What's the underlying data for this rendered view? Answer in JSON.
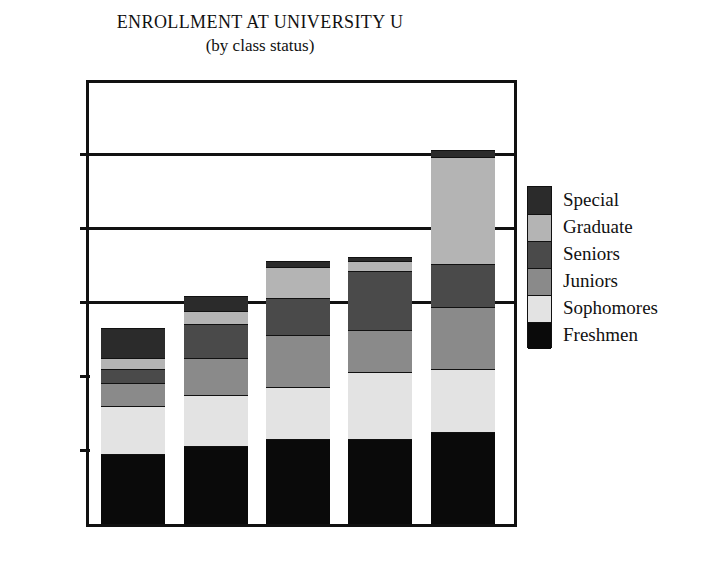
{
  "chart_data": {
    "type": "bar",
    "subtype": "stacked",
    "title": "ENROLLMENT AT UNIVERSITY U",
    "subtitle": "(by class status)",
    "xlabel": "",
    "ylabel": "",
    "categories": [
      "1991",
      "1992",
      "1993",
      "1994",
      "1995"
    ],
    "ytick_labels": [
      "1000",
      "2000",
      "3000",
      "4000",
      "5000"
    ],
    "ytick_values": [
      1000,
      2000,
      3000,
      4000,
      5000
    ],
    "ylim": [
      0,
      5960
    ],
    "grid": "horizontal-major",
    "legend_position": "right",
    "series": [
      {
        "name": "Freshmen",
        "color": "#0a0a0a",
        "values": [
          950,
          1050,
          1150,
          1150,
          1250
        ]
      },
      {
        "name": "Sophomores",
        "color": "#e3e3e3",
        "values": [
          650,
          700,
          700,
          900,
          850
        ]
      },
      {
        "name": "Juniors",
        "color": "#8a8a8a",
        "values": [
          300,
          500,
          700,
          575,
          830
        ]
      },
      {
        "name": "Seniors",
        "color": "#4a4a4a",
        "values": [
          200,
          450,
          500,
          800,
          580
        ]
      },
      {
        "name": "Graduate",
        "color": "#b4b4b4",
        "values": [
          150,
          175,
          430,
          125,
          1450
        ]
      },
      {
        "name": "Special",
        "color": "#2b2b2b",
        "values": [
          400,
          200,
          80,
          60,
          90
        ]
      }
    ],
    "stack_order_bottom_to_top": [
      "Freshmen",
      "Sophomores",
      "Juniors",
      "Seniors",
      "Graduate",
      "Special"
    ],
    "totals": [
      2650,
      3075,
      3560,
      3610,
      5050
    ]
  },
  "legend": {
    "entries": [
      {
        "label": "Special",
        "color": "#2b2b2b"
      },
      {
        "label": "Graduate",
        "color": "#b4b4b4"
      },
      {
        "label": "Seniors",
        "color": "#4a4a4a"
      },
      {
        "label": "Juniors",
        "color": "#8a8a8a"
      },
      {
        "label": "Sophomores",
        "color": "#e3e3e3"
      },
      {
        "label": "Freshmen",
        "color": "#0a0a0a"
      }
    ]
  },
  "axis": {
    "y_ticks": [
      {
        "label": "5000",
        "value": 5000
      },
      {
        "label": "4000",
        "value": 4000
      },
      {
        "label": "3000",
        "value": 3000
      },
      {
        "label": "2000",
        "value": 2000
      },
      {
        "label": "1000",
        "value": 1000
      }
    ],
    "x_ticks": [
      {
        "label": "1991"
      },
      {
        "label": "1992"
      },
      {
        "label": "1993"
      },
      {
        "label": "1994"
      },
      {
        "label": "1995"
      }
    ]
  }
}
